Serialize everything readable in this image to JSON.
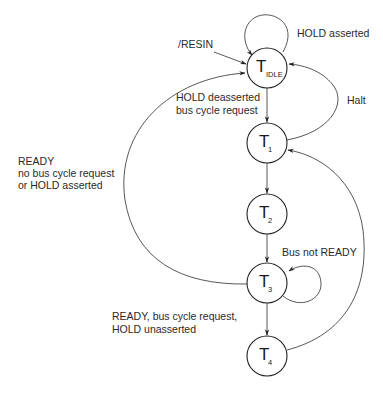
{
  "diagram": {
    "type": "state-machine",
    "colors": {
      "line": "#444444",
      "node_stroke": "#222222",
      "text": "#2a2a2a",
      "background": "#ffffff"
    },
    "states": [
      {
        "id": "idle",
        "main": "T",
        "sub": "IDLE"
      },
      {
        "id": "t1",
        "main": "T",
        "sub": "1"
      },
      {
        "id": "t2",
        "main": "T",
        "sub": "2"
      },
      {
        "id": "t3",
        "main": "T",
        "sub": "3"
      },
      {
        "id": "t4",
        "main": "T",
        "sub": "4"
      }
    ],
    "labels": {
      "resin": "/RESIN",
      "hold_asserted": "HOLD asserted",
      "hold_deasserted_1": "HOLD deasserted",
      "hold_deasserted_2": "bus cycle request",
      "halt": "Halt",
      "ready_left_1": "READY",
      "ready_left_2": "no bus cycle request",
      "ready_left_3": "or HOLD asserted",
      "bus_not_ready": "Bus not READY",
      "ready_bottom_1": "READY, bus cycle request,",
      "ready_bottom_2": "HOLD unasserted"
    },
    "transitions": [
      {
        "from": "external",
        "to": "idle",
        "label": "/RESIN"
      },
      {
        "from": "idle",
        "to": "idle",
        "label": "HOLD asserted"
      },
      {
        "from": "idle",
        "to": "t1",
        "label": "HOLD deasserted bus cycle request"
      },
      {
        "from": "t1",
        "to": "idle",
        "label": "Halt"
      },
      {
        "from": "t1",
        "to": "t2",
        "label": ""
      },
      {
        "from": "t2",
        "to": "t3",
        "label": ""
      },
      {
        "from": "t3",
        "to": "t3",
        "label": "Bus not READY"
      },
      {
        "from": "t3",
        "to": "idle",
        "label": "READY no bus cycle request or HOLD asserted"
      },
      {
        "from": "t3",
        "to": "t4",
        "label": "READY, bus cycle request, HOLD unasserted"
      },
      {
        "from": "t4",
        "to": "t1",
        "label": ""
      }
    ]
  }
}
